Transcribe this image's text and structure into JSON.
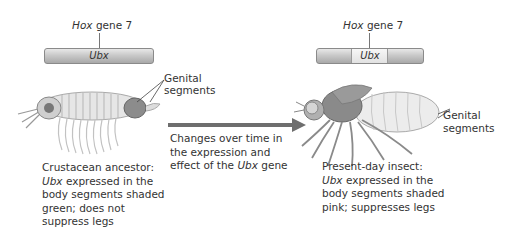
{
  "left": {
    "gene_label_italic": "Hox",
    "gene_label_rest": " gene 7",
    "gene_name": "Ubx",
    "genital_label_line1": "Genital",
    "genital_label_line2": "segments",
    "caption": {
      "line1": "Crustacean ancestor:",
      "line2_italic": "Ubx",
      "line2_rest": " expressed in the",
      "line3": "body segments shaded",
      "line4": "green; does not",
      "line5": "suppress legs"
    },
    "organism": "crustacean"
  },
  "middle": {
    "arrow_caption": {
      "line1": "Changes over time in",
      "line2": "the expression and",
      "line3_pre": "effect of the ",
      "line3_italic": "Ubx",
      "line3_post": " gene"
    }
  },
  "right": {
    "gene_label_italic": "Hox",
    "gene_label_rest": " gene 7",
    "gene_name": "Ubx",
    "genital_label_line1": "Genital",
    "genital_label_line2": "segments",
    "caption": {
      "line1": "Present-day insect:",
      "line2_italic": "Ubx",
      "line2_rest": " expressed in the",
      "line3": "body segments shaded",
      "line4": "pink; suppresses legs"
    },
    "organism": "fly"
  },
  "colors": {
    "arrow": "#6e6e6e",
    "text": "#333333",
    "gene_bar": "#bdbdbd"
  }
}
